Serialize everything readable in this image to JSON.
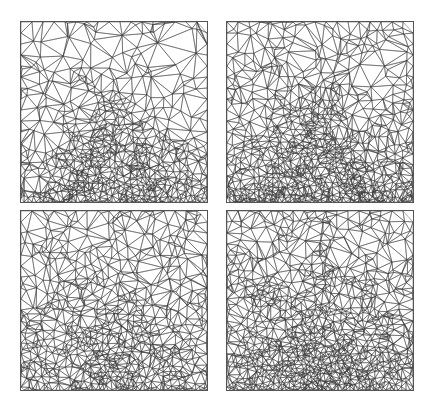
{
  "figure": {
    "line_color": "#3a3a3a",
    "background": "#ffffff",
    "panels": [
      {
        "id": "top-left",
        "x": 20,
        "y": 21,
        "w": 188,
        "h": 182,
        "pattern": "fan",
        "density": 1.0
      },
      {
        "id": "top-right",
        "x": 226,
        "y": 21,
        "w": 188,
        "h": 182,
        "pattern": "fan",
        "density": 1.35
      },
      {
        "id": "bottom-left",
        "x": 20,
        "y": 210,
        "w": 188,
        "h": 181,
        "pattern": "blob",
        "density": 1.0
      },
      {
        "id": "bottom-right",
        "x": 226,
        "y": 210,
        "w": 188,
        "h": 181,
        "pattern": "blob",
        "density": 1.45
      }
    ]
  }
}
